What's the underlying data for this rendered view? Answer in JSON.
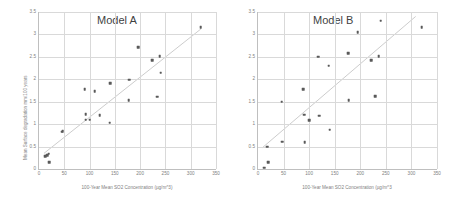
{
  "figure": {
    "background": "#ffffff",
    "marker_color": "#595959",
    "trendline_color": "#bfbfbf",
    "grid_color": "#d9d9d9",
    "axis_color": "#bfbfbf",
    "tick_text_color": "#808080",
    "title_color": "#3f3f3f"
  },
  "chart_data": [
    {
      "type": "scatter",
      "title": "Model A",
      "xlabel": "100-Year Mean SO2 Concentration (µg/m^3)",
      "ylabel": "Mean Surface degradation mm/100 years",
      "xlim": [
        0,
        350
      ],
      "ylim": [
        0,
        3.5
      ],
      "xticks": [
        0,
        50,
        100,
        150,
        200,
        250,
        300,
        350
      ],
      "xticklabels": [
        "0",
        "50",
        "100",
        "150",
        "200",
        "250",
        "300",
        "350"
      ],
      "yticks": [
        0,
        0.5,
        1,
        1.5,
        2,
        2.5,
        3,
        3.5
      ],
      "yticklabels": [
        "0",
        "0.5",
        "1",
        "1.5",
        "2",
        "2.5",
        "3",
        "3.5"
      ],
      "grid": true,
      "legend": "none",
      "points": [
        {
          "x": 12,
          "y": 0.28
        },
        {
          "x": 16,
          "y": 0.31
        },
        {
          "x": 19,
          "y": 0.34
        },
        {
          "x": 20,
          "y": 0.15
        },
        {
          "x": 45,
          "y": 0.83
        },
        {
          "x": 47,
          "y": 0.84
        },
        {
          "x": 90,
          "y": 1.78
        },
        {
          "x": 92,
          "y": 1.22
        },
        {
          "x": 92,
          "y": 1.1
        },
        {
          "x": 100,
          "y": 1.1
        },
        {
          "x": 110,
          "y": 1.73
        },
        {
          "x": 120,
          "y": 1.2
        },
        {
          "x": 140,
          "y": 1.03
        },
        {
          "x": 141,
          "y": 1.91
        },
        {
          "x": 177,
          "y": 1.53
        },
        {
          "x": 178,
          "y": 1.99
        },
        {
          "x": 196,
          "y": 2.72
        },
        {
          "x": 224,
          "y": 2.43
        },
        {
          "x": 234,
          "y": 1.61
        },
        {
          "x": 239,
          "y": 2.52
        },
        {
          "x": 241,
          "y": 2.15
        },
        {
          "x": 320,
          "y": 3.16
        }
      ],
      "trendline": {
        "x0": 10,
        "y0": 0.33,
        "x1": 322,
        "y1": 3.12
      }
    },
    {
      "type": "scatter",
      "title": "Model B",
      "xlabel": "100-Year Mean SO2 Concentration (µg/m^3",
      "ylabel": "",
      "xlim": [
        0,
        350
      ],
      "ylim": [
        0,
        3.5
      ],
      "xticks": [
        0,
        50,
        100,
        150,
        200,
        250,
        300,
        350
      ],
      "xticklabels": [
        "0",
        "50",
        "100",
        "150",
        "200",
        "250",
        "300",
        "350"
      ],
      "yticks": [
        0,
        0.5,
        1,
        1.5,
        2,
        2.5,
        3,
        3.5
      ],
      "yticklabels": [
        "0",
        "0.5",
        "1",
        "1.5",
        "2",
        "2.5",
        "3",
        "3.5"
      ],
      "grid": true,
      "legend": "none",
      "points": [
        {
          "x": 12,
          "y": 0.03
        },
        {
          "x": 18,
          "y": 0.5
        },
        {
          "x": 20,
          "y": 0.15
        },
        {
          "x": 46,
          "y": 1.5
        },
        {
          "x": 47,
          "y": 0.61
        },
        {
          "x": 88,
          "y": 1.78
        },
        {
          "x": 90,
          "y": 1.21
        },
        {
          "x": 91,
          "y": 0.6
        },
        {
          "x": 100,
          "y": 1.09
        },
        {
          "x": 118,
          "y": 2.5
        },
        {
          "x": 120,
          "y": 1.19
        },
        {
          "x": 138,
          "y": 2.3
        },
        {
          "x": 140,
          "y": 0.88
        },
        {
          "x": 176,
          "y": 2.58
        },
        {
          "x": 177,
          "y": 1.53
        },
        {
          "x": 195,
          "y": 3.05
        },
        {
          "x": 221,
          "y": 2.42
        },
        {
          "x": 229,
          "y": 1.62
        },
        {
          "x": 236,
          "y": 2.51
        },
        {
          "x": 240,
          "y": 3.31
        },
        {
          "x": 320,
          "y": 3.16
        }
      ],
      "trendline": {
        "x0": 8,
        "y0": 0.45,
        "x1": 310,
        "y1": 3.4
      }
    }
  ]
}
